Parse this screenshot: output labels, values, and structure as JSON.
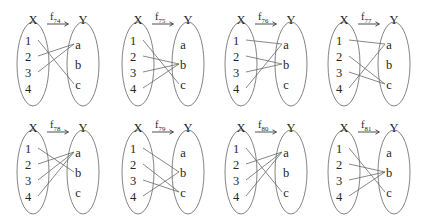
{
  "figure": {
    "caption": "",
    "rows": 2,
    "cols": 4,
    "domain_label": "X",
    "codomain_label": "Y"
  },
  "panels": [
    {
      "id": "panel-f74",
      "function_name": "f",
      "function_subscript": "74",
      "domain_label": "X",
      "codomain_label": "Y",
      "domain_elements": [
        "1",
        "2",
        "3",
        "4"
      ],
      "codomain_elements": [
        "a",
        "b",
        "c"
      ],
      "mappings": [
        {
          "from": "1",
          "to": "c"
        },
        {
          "from": "2",
          "to": "a"
        },
        {
          "from": "3",
          "to": "a"
        }
      ]
    },
    {
      "id": "panel-f75",
      "function_name": "f",
      "function_subscript": "75",
      "domain_label": "X",
      "codomain_label": "Y",
      "domain_elements": [
        "1",
        "2",
        "3",
        "4"
      ],
      "codomain_elements": [
        "a",
        "b",
        "c"
      ],
      "mappings": [
        {
          "from": "1",
          "to": "c"
        },
        {
          "from": "2",
          "to": "b"
        },
        {
          "from": "3",
          "to": "b"
        },
        {
          "from": "4",
          "to": "b"
        }
      ]
    },
    {
      "id": "panel-f76",
      "function_name": "f",
      "function_subscript": "76",
      "domain_label": "X",
      "codomain_label": "Y",
      "domain_elements": [
        "1",
        "2",
        "3",
        "4"
      ],
      "codomain_elements": [
        "a",
        "b",
        "c"
      ],
      "mappings": [
        {
          "from": "1",
          "to": "a"
        },
        {
          "from": "2",
          "to": "b"
        },
        {
          "from": "3",
          "to": "b"
        },
        {
          "from": "4",
          "to": "a"
        }
      ]
    },
    {
      "id": "panel-f77",
      "function_name": "f",
      "function_subscript": "77",
      "domain_label": "X",
      "codomain_label": "Y",
      "domain_elements": [
        "1",
        "2",
        "3",
        "4"
      ],
      "codomain_elements": [
        "a",
        "b",
        "c"
      ],
      "mappings": [
        {
          "from": "1",
          "to": "a"
        },
        {
          "from": "2",
          "to": "c"
        },
        {
          "from": "3",
          "to": "c"
        },
        {
          "from": "4",
          "to": "a"
        }
      ]
    },
    {
      "id": "panel-f78",
      "function_name": "f",
      "function_subscript": "78",
      "domain_label": "X",
      "codomain_label": "Y",
      "domain_elements": [
        "1",
        "2",
        "3",
        "4"
      ],
      "codomain_elements": [
        "a",
        "b",
        "c"
      ],
      "mappings": [
        {
          "from": "1",
          "to": "b"
        },
        {
          "from": "2",
          "to": "a"
        },
        {
          "from": "3",
          "to": "a"
        },
        {
          "from": "4",
          "to": "a"
        }
      ]
    },
    {
      "id": "panel-f79",
      "function_name": "f",
      "function_subscript": "79",
      "domain_label": "X",
      "codomain_label": "Y",
      "domain_elements": [
        "1",
        "2",
        "3",
        "4"
      ],
      "codomain_elements": [
        "a",
        "b",
        "c"
      ],
      "mappings": [
        {
          "from": "1",
          "to": "b"
        },
        {
          "from": "2",
          "to": "c"
        },
        {
          "from": "3",
          "to": "c"
        },
        {
          "from": "4",
          "to": "b"
        }
      ]
    },
    {
      "id": "panel-f80",
      "function_name": "f",
      "function_subscript": "80",
      "domain_label": "X",
      "codomain_label": "Y",
      "domain_elements": [
        "1",
        "2",
        "3",
        "4"
      ],
      "codomain_elements": [
        "a",
        "b",
        "c"
      ],
      "mappings": [
        {
          "from": "1",
          "to": "c"
        },
        {
          "from": "2",
          "to": "a"
        },
        {
          "from": "3",
          "to": "a"
        },
        {
          "from": "4",
          "to": "a"
        }
      ]
    },
    {
      "id": "panel-f81",
      "function_name": "f",
      "function_subscript": "81",
      "domain_label": "X",
      "codomain_label": "Y",
      "domain_elements": [
        "1",
        "2",
        "3",
        "4"
      ],
      "codomain_elements": [
        "a",
        "b",
        "c"
      ],
      "mappings": [
        {
          "from": "1",
          "to": "c"
        },
        {
          "from": "2",
          "to": "b"
        },
        {
          "from": "3",
          "to": "b"
        },
        {
          "from": "4",
          "to": "b"
        }
      ]
    }
  ],
  "colors": {
    "stroke": "#6e6e6e",
    "edge": "#6a6a6a",
    "text": "#252525",
    "background": "#ffffff"
  }
}
